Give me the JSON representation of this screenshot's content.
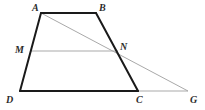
{
  "figure": {
    "background_color": "#ffffff",
    "stroke_primary_color": "#1a1a1a",
    "stroke_secondary_color": "#a9a9a9",
    "label_color": "#2b2b2b",
    "stroke_primary_width": 2,
    "stroke_secondary_width": 1,
    "viewbox": "0 0 205 110",
    "points": {
      "A": {
        "x": 41,
        "y": 13,
        "label": "A",
        "label_x": 32,
        "label_y": 3
      },
      "B": {
        "x": 96,
        "y": 13,
        "label": "B",
        "label_x": 99,
        "label_y": 3
      },
      "C": {
        "x": 138,
        "y": 91,
        "label": "C",
        "label_x": 136,
        "label_y": 95
      },
      "D": {
        "x": 20,
        "y": 91,
        "label": "D",
        "label_x": 6,
        "label_y": 95
      },
      "M": {
        "x": 30,
        "y": 51,
        "label": "M",
        "label_x": 15,
        "label_y": 45
      },
      "N": {
        "x": 118,
        "y": 51,
        "label": "N",
        "label_x": 120,
        "label_y": 42
      },
      "G": {
        "x": 188,
        "y": 91,
        "label": "G",
        "label_x": 190,
        "label_y": 95
      }
    },
    "segments": [
      {
        "name": "segment-AB",
        "from": "A",
        "to": "B",
        "style": "primary"
      },
      {
        "name": "segment-BC",
        "from": "B",
        "to": "C",
        "style": "primary"
      },
      {
        "name": "segment-CD",
        "from": "C",
        "to": "D",
        "style": "primary"
      },
      {
        "name": "segment-DA",
        "from": "D",
        "to": "A",
        "style": "primary"
      },
      {
        "name": "segment-MN",
        "from": "M",
        "to": "N",
        "style": "secondary"
      },
      {
        "name": "segment-AG",
        "from": "A",
        "to": "G",
        "style": "secondary"
      },
      {
        "name": "segment-CG",
        "from": "C",
        "to": "G",
        "style": "secondary"
      }
    ],
    "labels": [
      "A",
      "B",
      "M",
      "N",
      "D",
      "C",
      "G"
    ]
  }
}
